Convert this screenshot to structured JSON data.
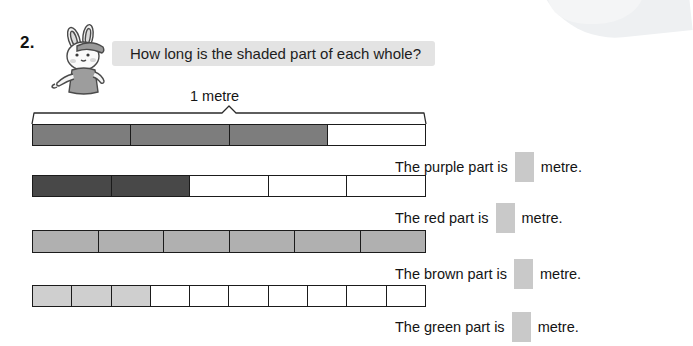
{
  "exercise": {
    "number": "2.",
    "question": "How long is the shaded part of each whole?",
    "scale_label": "1 metre"
  },
  "mascot": {
    "name": "rabbit-mascot",
    "description": "cartoon rabbit wearing cap pointing left"
  },
  "bars": [
    {
      "id": "bar-purple",
      "color_name": "purple",
      "fill": "#7d7d7d",
      "total_parts": 4,
      "shaded_parts": 3,
      "fraction": "3/4"
    },
    {
      "id": "bar-red",
      "color_name": "red",
      "fill": "#484848",
      "total_parts": 5,
      "shaded_parts": 2,
      "fraction": "2/5"
    },
    {
      "id": "bar-brown",
      "color_name": "brown",
      "fill": "#b0b0b0",
      "total_parts": 6,
      "shaded_parts": 6,
      "fraction": "6/6"
    },
    {
      "id": "bar-green",
      "color_name": "green",
      "fill": "#cfcfcf",
      "total_parts": 10,
      "shaded_parts": 3,
      "fraction": "3/10"
    }
  ],
  "answers": [
    {
      "prefix": "The purple part is",
      "suffix": "metre.",
      "value": ""
    },
    {
      "prefix": "The red part is",
      "suffix": "metre.",
      "value": ""
    },
    {
      "prefix": "The brown part is",
      "suffix": "metre.",
      "value": ""
    },
    {
      "prefix": "The green part is",
      "suffix": "metre.",
      "value": ""
    }
  ],
  "colors": {
    "banner_bg": "#e3e3e3",
    "answer_box": "#c9c9c9",
    "outline": "#1b1b1b",
    "page_bg": "#ffffff"
  }
}
